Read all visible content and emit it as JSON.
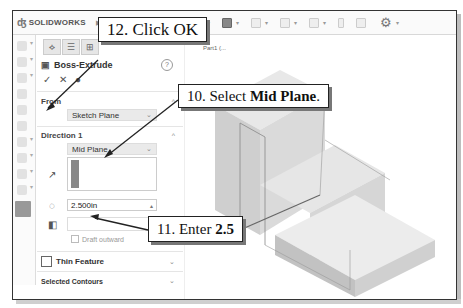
{
  "app": {
    "logo_text": "SOLIDWORKS",
    "part_label": "Part1 (..."
  },
  "toolbar": {
    "icons": [
      "home-icon",
      "new-icon",
      "open-icon",
      "save-icon",
      "print-icon",
      "undo-icon",
      "redo-icon",
      "select-icon",
      "rebuild-icon",
      "file-props-icon",
      "options-gear-icon"
    ]
  },
  "panel": {
    "feature_title": "Boss-Extrude",
    "help_symbol": "?",
    "ok_symbol": "✓",
    "cancel_symbol": "✕",
    "preview_symbol": "👁",
    "from": {
      "label": "From",
      "value": "Sketch Plane"
    },
    "direction1": {
      "label": "Direction 1",
      "end_condition": "Mid Plane",
      "depth": "2.500in",
      "draft_label": "Draft outward"
    },
    "thin_feature": {
      "label": "Thin Feature",
      "checked": false
    },
    "selected_contours": {
      "label": "Selected Contours"
    }
  },
  "callouts": {
    "step12": "12. Click OK",
    "step10_prefix": "10. Select ",
    "step10_bold": "Mid Plane",
    "step10_suffix": ".",
    "step11_prefix": "11. Enter ",
    "step11_bold": "2.5"
  }
}
